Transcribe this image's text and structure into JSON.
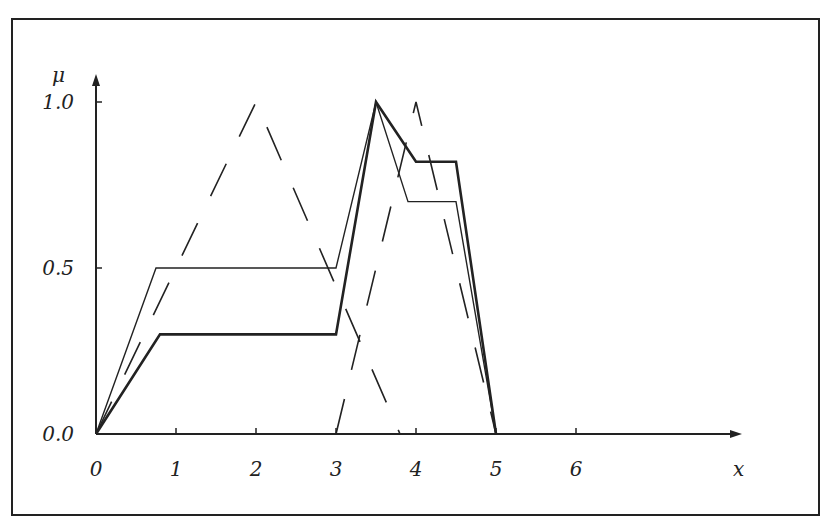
{
  "chart_data": {
    "type": "line",
    "title": "",
    "xlabel": "x",
    "ylabel": "μ",
    "x_ticks": [
      "0",
      "1",
      "2",
      "3",
      "4",
      "5",
      "6"
    ],
    "y_ticks": [
      "0.0",
      "0.5",
      "1.0"
    ],
    "xlim": [
      0,
      8
    ],
    "ylim": [
      0,
      1.1
    ],
    "grid": false,
    "legend": "none",
    "series": [
      {
        "name": "dashed triangle A",
        "style": "dashed",
        "points": [
          [
            0,
            0
          ],
          [
            2,
            1
          ],
          [
            3.8,
            0
          ]
        ]
      },
      {
        "name": "dashed triangle B",
        "style": "dashed",
        "points": [
          [
            3,
            0
          ],
          [
            4,
            1
          ],
          [
            5,
            0
          ]
        ]
      },
      {
        "name": "thin aggregate",
        "style": "thin",
        "points": [
          [
            0,
            0
          ],
          [
            0.75,
            0.5
          ],
          [
            3,
            0.5
          ],
          [
            3.5,
            1
          ],
          [
            3.9,
            0.7
          ],
          [
            4.5,
            0.7
          ],
          [
            5,
            0
          ]
        ]
      },
      {
        "name": "thick aggregate",
        "style": "thick",
        "points": [
          [
            0,
            0
          ],
          [
            0.8,
            0.3
          ],
          [
            3,
            0.3
          ],
          [
            3.5,
            1
          ],
          [
            4,
            0.82
          ],
          [
            4.5,
            0.82
          ],
          [
            5,
            0
          ]
        ]
      }
    ]
  }
}
